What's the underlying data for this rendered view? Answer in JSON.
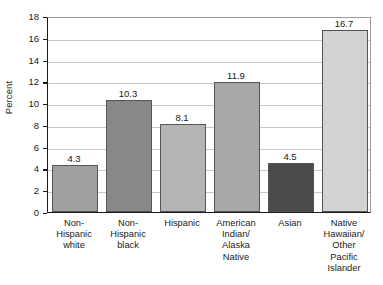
{
  "chart_data": {
    "type": "bar",
    "title": "",
    "subtitle": "",
    "xlabel": "",
    "ylabel": "Percent",
    "ylim": [
      0,
      18
    ],
    "ytick_step": 2,
    "yticks": [
      "0",
      "2",
      "4",
      "6",
      "8",
      "10",
      "12",
      "14",
      "16",
      "18"
    ],
    "grid": true,
    "legend": "none",
    "categories": [
      "Non-\nHispanic\nwhite",
      "Non-\nHispanic\nblack",
      "Hispanic",
      "American\nIndian/\nAlaska\nNative",
      "Asian",
      "Native\nHawaiian/\nOther\nPacific\nIslander"
    ],
    "values": [
      4.3,
      10.3,
      8.1,
      11.9,
      4.5,
      16.7
    ],
    "value_labels": [
      "4.3",
      "10.3",
      "8.1",
      "11.9",
      "4.5",
      "16.7"
    ],
    "bar_colors": [
      "#a0a0a0",
      "#888888",
      "#b5b5b5",
      "#a8a8a8",
      "#4a4a4a",
      "#d2d2d2"
    ],
    "bar_border_color": "#555555",
    "gridline_color": "#c9c9c9",
    "axis_color": "#1a1a1a",
    "background_color": "#ffffff"
  }
}
